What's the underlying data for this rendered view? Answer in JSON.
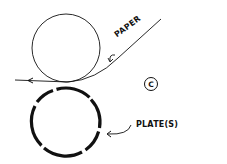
{
  "diagram": {
    "type": "offset printing cylinder schematic",
    "labels": {
      "paper": "PAPER",
      "plates": "PLATE(S)",
      "panel": "C"
    },
    "components": [
      {
        "name": "impression-cylinder",
        "shape": "circle",
        "position": "top"
      },
      {
        "name": "plate-cylinder",
        "shape": "circle with segmented plates",
        "position": "bottom"
      },
      {
        "name": "paper-web",
        "shape": "line",
        "direction": "enters upper-right, exits left"
      }
    ],
    "colors": {
      "stroke": "#111111",
      "background": "#ffffff"
    }
  }
}
